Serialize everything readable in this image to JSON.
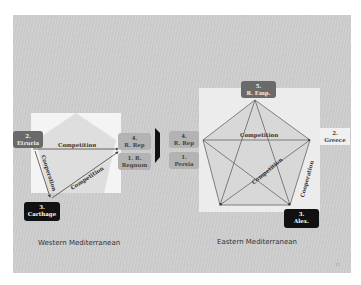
{
  "west": {
    "title": "Western Mediterranean",
    "nodes": [
      {
        "id": "etruria",
        "num": "2.",
        "name": "Etruria"
      },
      {
        "id": "rrep",
        "num": "4.",
        "name": "R. Rep"
      },
      {
        "id": "regnum",
        "num": "1. R.",
        "name": "Regnum"
      },
      {
        "id": "carthage",
        "num": "3.",
        "name": "Carthage"
      }
    ],
    "edges": {
      "top": "Competition",
      "left": "Cooperation",
      "diag": "Competition"
    }
  },
  "east": {
    "title": "Eastern Mediterranean",
    "nodes": [
      {
        "id": "remp",
        "num": "5.",
        "name": "R. Emp."
      },
      {
        "id": "rrep",
        "num": "4.",
        "name": "R. Rep"
      },
      {
        "id": "persia",
        "num": "1.",
        "name": "Persia"
      },
      {
        "id": "greece",
        "num": "2.",
        "name": "Greece"
      },
      {
        "id": "alex",
        "num": "3.",
        "name": "Alex."
      }
    ],
    "edges": {
      "top": "Competition",
      "center": "Competition",
      "right": "Cooperation"
    }
  },
  "colors": {
    "dark": "#111111",
    "mid": "#6a6a6a",
    "light": "#b3b3b3",
    "slide": "#cccccc"
  },
  "page_number": "11"
}
